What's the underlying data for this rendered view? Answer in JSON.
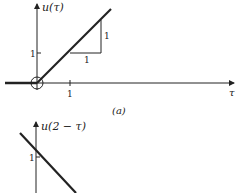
{
  "figure_a": {
    "y_axis_label": "u(τ)",
    "x_axis_label": "τ",
    "x_tick_label": "1",
    "y_tick_label": "1",
    "slope_run_label": "1",
    "slope_rise_label": "1",
    "caption": "(a)"
  },
  "figure_b": {
    "y_axis_label": "u(2 − τ)",
    "y_tick_label": "1"
  },
  "colors": {
    "ink": "#222222",
    "background": "#ffffff"
  }
}
